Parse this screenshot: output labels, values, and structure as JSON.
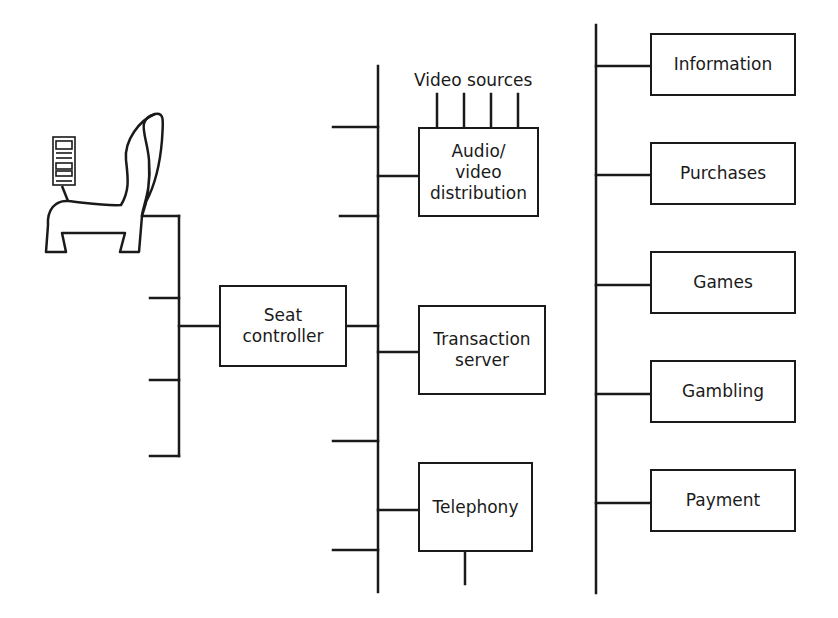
{
  "diagram": {
    "seat_controller": {
      "label": "Seat\ncontroller"
    },
    "av_distribution": {
      "label": "Audio/\nvideo\ndistribution"
    },
    "video_sources": {
      "label": "Video sources",
      "count": 4
    },
    "transaction_server": {
      "label": "Transaction\nserver"
    },
    "telephony": {
      "label": "Telephony"
    },
    "services": [
      {
        "label": "Information"
      },
      {
        "label": "Purchases"
      },
      {
        "label": "Games"
      },
      {
        "label": "Gambling"
      },
      {
        "label": "Payment"
      }
    ],
    "seat_icon": "airline-seat-with-handset",
    "colors": {
      "line": "#1a1a1a",
      "background": "#ffffff"
    }
  }
}
